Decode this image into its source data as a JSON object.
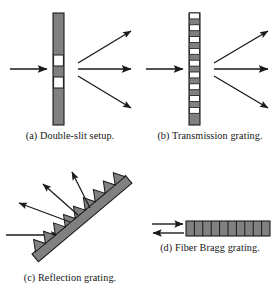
{
  "figure": {
    "background": "#ffffff",
    "ink_color": "#1a1a1a",
    "grating_fill": "#808080",
    "slit_fill": "#ffffff",
    "outline_color": "#1a1a1a"
  },
  "panels": [
    {
      "id": "a",
      "label": "(a) Double-slit setup.",
      "kind": "double-slit",
      "element": {
        "name": "barrier-with-two-slits",
        "orientation": "vertical",
        "bar": {
          "x": 53,
          "y": 13,
          "width": 11,
          "height": 112
        },
        "slits": [
          {
            "y": 55,
            "height": 11
          },
          {
            "y": 77,
            "height": 11
          }
        ]
      },
      "incoming_arrows": [
        {
          "name": "incident-beam",
          "x1": 10,
          "y1": 69,
          "x2": 48,
          "y2": 69
        }
      ],
      "outgoing_arrows": [
        {
          "name": "diffracted-order-plus-one",
          "x1": 78,
          "y1": 63,
          "x2": 133,
          "y2": 31
        },
        {
          "name": "diffracted-order-zero",
          "x1": 78,
          "y1": 69,
          "x2": 133,
          "y2": 69
        },
        {
          "name": "diffracted-order-minus-one",
          "x1": 78,
          "y1": 76,
          "x2": 133,
          "y2": 108
        }
      ]
    },
    {
      "id": "b",
      "label": "(b) Transmission grating.",
      "kind": "transmission-grating",
      "element": {
        "name": "periodic-slit-grating",
        "orientation": "vertical",
        "bar": {
          "x": 189,
          "y": 13,
          "width": 11,
          "height": 112
        },
        "stripe_count": 19,
        "stripe_pattern": "alternating opaque and transparent"
      },
      "incoming_arrows": [
        {
          "name": "incident-beam",
          "x1": 146,
          "y1": 69,
          "x2": 184,
          "y2": 69
        }
      ],
      "outgoing_arrows": [
        {
          "name": "diffracted-order-plus-one",
          "x1": 214,
          "y1": 63,
          "x2": 269,
          "y2": 31
        },
        {
          "name": "diffracted-order-zero",
          "x1": 214,
          "y1": 69,
          "x2": 269,
          "y2": 69
        },
        {
          "name": "diffracted-order-minus-one",
          "x1": 214,
          "y1": 76,
          "x2": 269,
          "y2": 108
        }
      ]
    },
    {
      "id": "c",
      "label": "(c) Reflection grating.",
      "kind": "reflection-grating",
      "element": {
        "name": "blazed-sawtooth-surface",
        "orientation": "diagonal",
        "angle_deg": -40,
        "tooth_count": 9,
        "substrate": {
          "x1": 33,
          "y1": 255,
          "x2": 128,
          "y2": 175,
          "thickness": 10
        }
      },
      "incoming_arrows": [
        {
          "name": "incident-beam",
          "x1": 8,
          "y1": 235,
          "x2": 62,
          "y2": 235
        }
      ],
      "outgoing_arrows": [
        {
          "name": "reflected-order-minus-one",
          "x1": 70,
          "y1": 222,
          "x2": 20,
          "y2": 203
        },
        {
          "name": "reflected-order-zero",
          "x1": 78,
          "y1": 215,
          "x2": 44,
          "y2": 185
        },
        {
          "name": "reflected-order-plus-one",
          "x1": 90,
          "y1": 208,
          "x2": 72,
          "y2": 172
        }
      ]
    },
    {
      "id": "d",
      "label": "(d) Fiber Bragg grating.",
      "kind": "fiber-bragg-grating",
      "element": {
        "name": "fiber-core-with-index-modulation",
        "orientation": "horizontal",
        "bar": {
          "x": 186,
          "y": 221,
          "width": 84,
          "height": 15
        },
        "period_count": 10
      },
      "incoming_arrows": [
        {
          "name": "incident-beam",
          "x1": 152,
          "y1": 224,
          "x2": 183,
          "y2": 224
        }
      ],
      "outgoing_arrows": [
        {
          "name": "back-reflected-beam",
          "x1": 183,
          "y1": 233,
          "x2": 152,
          "y2": 233
        }
      ]
    }
  ]
}
